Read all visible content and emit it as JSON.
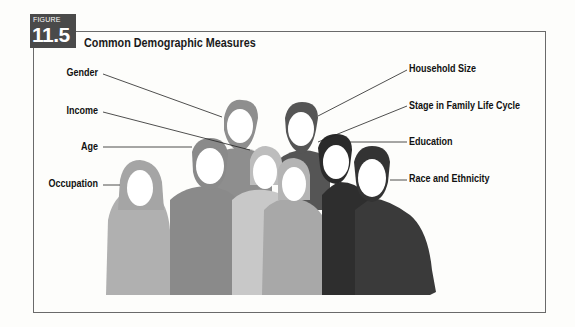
{
  "figure": {
    "badge_label": "FIGURE",
    "badge_number": "11.5",
    "title": "Common Demographic Measures"
  },
  "labels_left": [
    {
      "text": "Gender"
    },
    {
      "text": "Income"
    },
    {
      "text": "Age"
    },
    {
      "text": "Occupation"
    }
  ],
  "labels_right": [
    {
      "text": "Household Size"
    },
    {
      "text": "Stage in Family Life Cycle"
    },
    {
      "text": "Education"
    },
    {
      "text": "Race and Ethnicity"
    }
  ],
  "colors": {
    "badge": "#4a4a4a",
    "frame": "#6a6a6a",
    "silhouette_light": "#b9b9b9",
    "silhouette_mid": "#8e8e8e",
    "silhouette_dark": "#3a3a3a",
    "face": "#ffffff"
  }
}
